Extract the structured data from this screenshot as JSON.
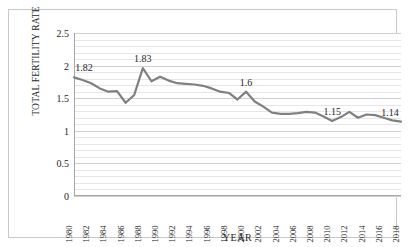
{
  "chart_data": {
    "type": "line",
    "title": "",
    "xlabel": "YEAR",
    "ylabel": "TOTAL FERTILITY RATE",
    "xlim": [
      1980,
      2018
    ],
    "ylim": [
      0,
      2.5
    ],
    "yticks": [
      "2.5",
      "2",
      "1.5",
      "1",
      "0.5",
      "0"
    ],
    "ytick_values": [
      2.5,
      2,
      1.5,
      1,
      0.5,
      0
    ],
    "grid": "horizontal-minor-0.1",
    "legend": "none",
    "line_color": "#808080",
    "categories": [
      1980,
      1981,
      1982,
      1983,
      1984,
      1985,
      1986,
      1987,
      1988,
      1989,
      1990,
      1991,
      1992,
      1993,
      1994,
      1995,
      1996,
      1997,
      1998,
      1999,
      2000,
      2001,
      2002,
      2003,
      2004,
      2005,
      2006,
      2007,
      2008,
      2009,
      2010,
      2011,
      2012,
      2013,
      2014,
      2015,
      2016,
      2017,
      2018
    ],
    "xtick_labels": [
      "1980",
      "1982",
      "1984",
      "1986",
      "1988",
      "1990",
      "1992",
      "1994",
      "1996",
      "1998",
      "2000",
      "2002",
      "2004",
      "2006",
      "2008",
      "2010",
      "2012",
      "2014",
      "2016",
      "2018"
    ],
    "values": [
      1.82,
      1.78,
      1.73,
      1.65,
      1.6,
      1.61,
      1.43,
      1.55,
      1.96,
      1.76,
      1.83,
      1.77,
      1.73,
      1.72,
      1.71,
      1.69,
      1.65,
      1.6,
      1.58,
      1.48,
      1.6,
      1.45,
      1.37,
      1.28,
      1.26,
      1.26,
      1.27,
      1.29,
      1.28,
      1.22,
      1.15,
      1.21,
      1.29,
      1.2,
      1.25,
      1.24,
      1.2,
      1.16,
      1.14
    ],
    "data_labels": [
      {
        "year": 1980,
        "value": 1.82,
        "text": "1.82"
      },
      {
        "year": 1988,
        "value": 1.96,
        "text": "1.83"
      },
      {
        "year": 2000,
        "value": 1.6,
        "text": "1.6"
      },
      {
        "year": 2010,
        "value": 1.15,
        "text": "1.15"
      },
      {
        "year": 2018,
        "value": 1.14,
        "text": "1.14"
      }
    ]
  }
}
